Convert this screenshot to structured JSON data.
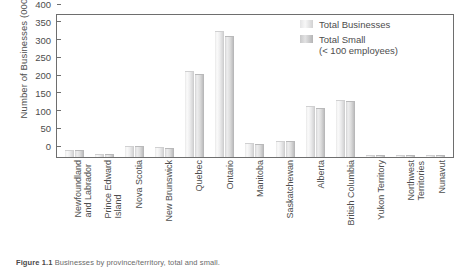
{
  "chart_data": {
    "type": "bar",
    "title": "",
    "xlabel": "",
    "ylabel": "Number of Businesses (000's)",
    "ylim": [
      0,
      400
    ],
    "yticks": [
      0,
      50,
      100,
      150,
      200,
      250,
      300,
      350,
      400
    ],
    "grid": false,
    "legend_position": "top-right",
    "categories": [
      "Newfoundland and Labrador",
      "Prince Edward Island",
      "Nova Scotia",
      "New Brunswick",
      "Quebec",
      "Ontario",
      "Manitoba",
      "Saskatchewan",
      "Alberta",
      "British Columbia",
      "Yukon Territory",
      "Northwest Territories",
      "Nunavut"
    ],
    "category_lines": [
      [
        "Newfoundland",
        "and Labrador"
      ],
      [
        "Prince Edward",
        "Island"
      ],
      [
        "Nova Scotia",
        ""
      ],
      [
        "New Brunswick",
        ""
      ],
      [
        "Quebec",
        ""
      ],
      [
        "Ontario",
        ""
      ],
      [
        "Manitoba",
        ""
      ],
      [
        "Saskatchewan",
        ""
      ],
      [
        "Alberta",
        ""
      ],
      [
        "British Columbia",
        ""
      ],
      [
        "Yukon Territory",
        ""
      ],
      [
        "Northwest",
        "Territories"
      ],
      [
        "Nunavut",
        ""
      ]
    ],
    "series": [
      {
        "name": "Total Businesses",
        "color": "#ededee",
        "values": [
          17,
          7,
          29,
          24,
          240,
          351,
          37,
          42,
          141,
          159,
          3,
          3,
          1
        ]
      },
      {
        "name": "Total Small",
        "color": "#d4d4d5",
        "values": [
          16,
          7,
          28,
          23,
          231,
          338,
          35,
          41,
          136,
          156,
          3,
          3,
          1
        ]
      }
    ]
  },
  "legend": {
    "entries": [
      {
        "label": "Total Businesses",
        "sub": ""
      },
      {
        "label": "Total Small",
        "sub": "(< 100 employees)"
      }
    ]
  },
  "caption": {
    "prefix": "Figure 1.1",
    "text": "Businesses by province/territory, total and small."
  }
}
